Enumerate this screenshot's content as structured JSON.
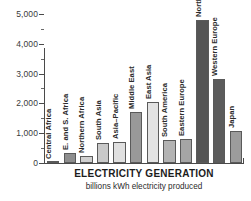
{
  "chart_data": {
    "type": "bar",
    "title": "ELECTRICITY GENERATION",
    "subtitle": "billions kWh electricity produced",
    "xlabel": "",
    "ylabel": "",
    "ylim": [
      0,
      5200
    ],
    "grid": false,
    "legend": "none",
    "orientation": "vertical",
    "yticks": [
      0,
      1000,
      2000,
      3000,
      4000,
      5000
    ],
    "ytick_labels": [
      "0",
      "1,000",
      "2,000",
      "3,000",
      "4,000",
      "5,000"
    ],
    "yminor_ticks": [
      500,
      1500,
      2500,
      3500,
      4500
    ],
    "categories": [
      "Central Africa",
      "E. and S. Africa",
      "Northern Africa",
      "South Asia",
      "Asia–Pacific",
      "Middle East",
      "East Asia",
      "South America",
      "Eastern Europe",
      "North America",
      "Western Europe",
      "Japan"
    ],
    "values": [
      40,
      330,
      230,
      680,
      700,
      1700,
      2050,
      770,
      800,
      4800,
      2830,
      1080
    ],
    "bar_colors": [
      "#d8d8d8",
      "#8e8e8e",
      "#d0d0d0",
      "#c9c9c9",
      "#e0e0e0",
      "#999999",
      "#e3e3e3",
      "#b3b3b3",
      "#a5a5a5",
      "#555555",
      "#5c5c5c",
      "#9c9c9c"
    ],
    "bar_edge_color": "#5a5a5a",
    "axis_color": "#4a4a4a"
  }
}
